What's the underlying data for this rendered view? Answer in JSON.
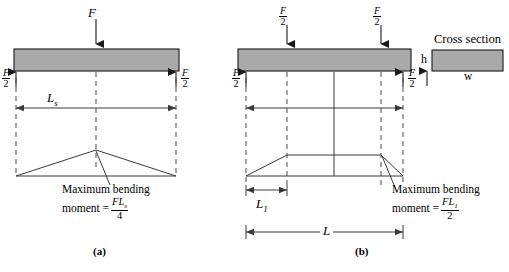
{
  "figure": {
    "type": "beam-bending-moment-diagram",
    "panels": [
      {
        "caption": "(a)",
        "loading": "three-point-bending",
        "applied_load_label": "F",
        "reaction_label_num": "F",
        "reaction_label_den": "2",
        "span_label": "L",
        "span_label_sub": "s",
        "moment_note_line1": "Maximum bending",
        "moment_note_line2": "moment =",
        "moment_numerator": "FL",
        "moment_numerator_sub": "s",
        "moment_denominator": "4",
        "moment_shape": "triangle"
      },
      {
        "caption": "(b)",
        "loading": "four-point-bending",
        "applied_load_num": "F",
        "applied_load_den": "2",
        "reaction_label_num": "F",
        "reaction_label_den": "2",
        "inner_span_label": "L",
        "inner_span_sub": "1",
        "outer_span_label": "L",
        "moment_note_line1": "Maximum bending",
        "moment_note_line2": "moment =",
        "moment_numerator": "FL",
        "moment_numerator_sub": "1",
        "moment_denominator": "2",
        "moment_shape": "trapezoid"
      }
    ],
    "cross_section": {
      "title": "Cross section",
      "height_label": "h",
      "width_label": "w"
    },
    "colors": {
      "beam_fill": "#a9a9a9",
      "beam_stroke": "#1a1a1a",
      "line": "#3a3a3a",
      "dashed": "#4a4a4a",
      "text": "#000000"
    }
  }
}
